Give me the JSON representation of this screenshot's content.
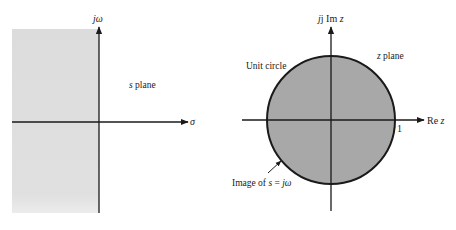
{
  "s_plane": {
    "title": "s plane",
    "title_var": "s",
    "title_rest": " plane",
    "vertical_axis_label": "jω",
    "horizontal_axis_label": "σ",
    "shaded_region": "left half-plane",
    "shade_color": "#dcdcdc"
  },
  "z_plane": {
    "title_var": "z",
    "title_rest": " plane",
    "vertical_axis_label_prefix": "j Im ",
    "vertical_axis_label_var": "z",
    "horizontal_axis_label_prefix": "Re ",
    "horizontal_axis_label_var": "z",
    "unit_circle_label": "Unit circle",
    "unit_tick_label": "1",
    "image_label_prefix": "Image of ",
    "image_label_var": "s",
    "image_label_eq": " = ",
    "image_label_rhs": "jω",
    "circle_fill_color": "#a8a8a8"
  },
  "colors": {
    "axis": "#1a1a1a",
    "background": "#ffffff"
  }
}
